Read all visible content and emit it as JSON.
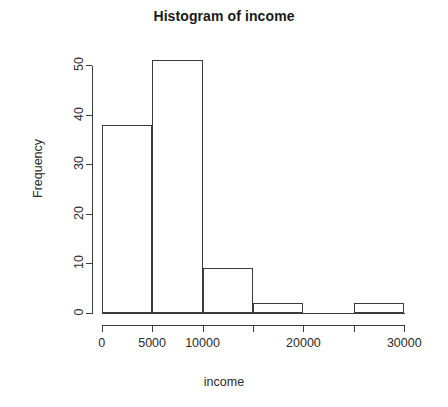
{
  "chart_data": {
    "type": "bar",
    "title": "Histogram of income",
    "xlabel": "income",
    "ylabel": "Frequency",
    "bin_width": 5000,
    "bin_edges": [
      0,
      5000,
      10000,
      15000,
      20000,
      25000,
      30000
    ],
    "categories": [
      "0-5000",
      "5000-10000",
      "10000-15000",
      "15000-20000",
      "20000-25000",
      "25000-30000"
    ],
    "values": [
      38,
      51,
      9,
      2,
      0,
      2
    ],
    "bars": [
      {
        "label": "0-5000",
        "x0": 0,
        "x1": 5000,
        "value": 38
      },
      {
        "label": "5000-10000",
        "x0": 5000,
        "x1": 10000,
        "value": 51
      },
      {
        "label": "10000-15000",
        "x0": 10000,
        "x1": 15000,
        "value": 9
      },
      {
        "label": "15000-20000",
        "x0": 15000,
        "x1": 20000,
        "value": 2
      },
      {
        "label": "20000-25000",
        "x0": 20000,
        "x1": 25000,
        "value": 0
      },
      {
        "label": "25000-30000",
        "x0": 25000,
        "x1": 30000,
        "value": 2
      }
    ],
    "xlim": [
      0,
      30000
    ],
    "ylim": [
      0,
      51
    ],
    "x_ticks": [
      0,
      5000,
      10000,
      15000,
      20000,
      25000,
      30000
    ],
    "x_tick_labels": [
      "0",
      "5000",
      "10000",
      "",
      "20000",
      "",
      "30000"
    ],
    "y_ticks": [
      0,
      10,
      20,
      30,
      40,
      50
    ],
    "y_tick_labels": [
      "0",
      "10",
      "20",
      "30",
      "40",
      "50"
    ],
    "grid": false,
    "legend": "none",
    "bar_fill_color": "#ffffff",
    "bar_border_color": "#3b3b3b",
    "axis_color": "#3b3b3b",
    "background_color": "#ffffff"
  }
}
